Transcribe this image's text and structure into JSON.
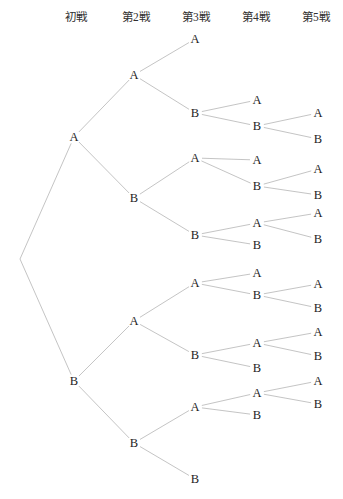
{
  "figure": {
    "width": 343,
    "height": 499,
    "background_color": "#ffffff",
    "line_color": "#b5b5b5",
    "text_color": "#242424"
  },
  "headers": [
    {
      "label": "初戦",
      "x": 76,
      "y": 16
    },
    {
      "label": "第2戦",
      "x": 136,
      "y": 16
    },
    {
      "label": "第3戦",
      "x": 196,
      "y": 16
    },
    {
      "label": "第4戦",
      "x": 256,
      "y": 16
    },
    {
      "label": "第5戦",
      "x": 316,
      "y": 16
    }
  ],
  "chart_data": {
    "type": "diagram",
    "subtype": "binary-tree",
    "title": "",
    "columns": [
      "初戦",
      "第2戦",
      "第3戦",
      "第4戦",
      "第5戦"
    ],
    "column_x": [
      76,
      136,
      196,
      256,
      316
    ],
    "root": {
      "id": "r",
      "label": "",
      "x": 20,
      "y": 259
    },
    "nodes": [
      {
        "id": "A",
        "label": "A",
        "x": 74,
        "y": 137,
        "game": 1,
        "parent": "r"
      },
      {
        "id": "B",
        "label": "B",
        "x": 74,
        "y": 381,
        "game": 1,
        "parent": "r"
      },
      {
        "id": "AA",
        "label": "A",
        "x": 134,
        "y": 75,
        "game": 2,
        "parent": "A"
      },
      {
        "id": "AB",
        "label": "B",
        "x": 134,
        "y": 198,
        "game": 2,
        "parent": "A"
      },
      {
        "id": "BA",
        "label": "A",
        "x": 134,
        "y": 321,
        "game": 2,
        "parent": "B"
      },
      {
        "id": "BB",
        "label": "B",
        "x": 134,
        "y": 443,
        "game": 2,
        "parent": "B"
      },
      {
        "id": "AAA",
        "label": "A",
        "x": 195,
        "y": 39,
        "game": 3,
        "parent": "AA",
        "terminal": true
      },
      {
        "id": "AAB",
        "label": "B",
        "x": 195,
        "y": 113,
        "game": 3,
        "parent": "AA"
      },
      {
        "id": "ABA",
        "label": "A",
        "x": 195,
        "y": 158,
        "game": 3,
        "parent": "AB"
      },
      {
        "id": "ABB",
        "label": "B",
        "x": 195,
        "y": 235,
        "game": 3,
        "parent": "AB"
      },
      {
        "id": "BAA",
        "label": "A",
        "x": 195,
        "y": 283,
        "game": 3,
        "parent": "BA"
      },
      {
        "id": "BAB",
        "label": "B",
        "x": 195,
        "y": 355,
        "game": 3,
        "parent": "BA"
      },
      {
        "id": "BBA",
        "label": "A",
        "x": 195,
        "y": 407,
        "game": 3,
        "parent": "BB"
      },
      {
        "id": "BBB",
        "label": "B",
        "x": 195,
        "y": 479,
        "game": 3,
        "parent": "BB",
        "terminal": true
      },
      {
        "id": "AABA",
        "label": "A",
        "x": 257,
        "y": 100,
        "game": 4,
        "parent": "AAB",
        "terminal": true
      },
      {
        "id": "AABB",
        "label": "B",
        "x": 257,
        "y": 126,
        "game": 4,
        "parent": "AAB"
      },
      {
        "id": "ABAA",
        "label": "A",
        "x": 257,
        "y": 160,
        "game": 4,
        "parent": "ABA",
        "terminal": true
      },
      {
        "id": "ABAB",
        "label": "B",
        "x": 257,
        "y": 186,
        "game": 4,
        "parent": "ABA"
      },
      {
        "id": "ABBA",
        "label": "A",
        "x": 257,
        "y": 223,
        "game": 4,
        "parent": "ABB"
      },
      {
        "id": "ABBB",
        "label": "B",
        "x": 257,
        "y": 245,
        "game": 4,
        "parent": "ABB",
        "terminal": true
      },
      {
        "id": "BAAA",
        "label": "A",
        "x": 257,
        "y": 273,
        "game": 4,
        "parent": "BAA",
        "terminal": true
      },
      {
        "id": "BAAB",
        "label": "B",
        "x": 257,
        "y": 295,
        "game": 4,
        "parent": "BAA"
      },
      {
        "id": "BABA",
        "label": "A",
        "x": 257,
        "y": 343,
        "game": 4,
        "parent": "BAB"
      },
      {
        "id": "BABB",
        "label": "B",
        "x": 257,
        "y": 368,
        "game": 4,
        "parent": "BAB",
        "terminal": true
      },
      {
        "id": "BBAA",
        "label": "A",
        "x": 257,
        "y": 393,
        "game": 4,
        "parent": "BBA"
      },
      {
        "id": "BBAB",
        "label": "B",
        "x": 257,
        "y": 415,
        "game": 4,
        "parent": "BBA",
        "terminal": true
      },
      {
        "id": "AABBA",
        "label": "A",
        "x": 318,
        "y": 113,
        "game": 5,
        "parent": "AABB",
        "terminal": true
      },
      {
        "id": "AABBB",
        "label": "B",
        "x": 318,
        "y": 139,
        "game": 5,
        "parent": "AABB",
        "terminal": true
      },
      {
        "id": "ABABA",
        "label": "A",
        "x": 318,
        "y": 169,
        "game": 5,
        "parent": "ABAB",
        "terminal": true
      },
      {
        "id": "ABABB",
        "label": "B",
        "x": 318,
        "y": 195,
        "game": 5,
        "parent": "ABAB",
        "terminal": true
      },
      {
        "id": "ABBAA",
        "label": "A",
        "x": 318,
        "y": 213,
        "game": 5,
        "parent": "ABBA",
        "terminal": true
      },
      {
        "id": "ABBAB",
        "label": "B",
        "x": 318,
        "y": 239,
        "game": 5,
        "parent": "ABBA",
        "terminal": true
      },
      {
        "id": "BAABA",
        "label": "A",
        "x": 318,
        "y": 284,
        "game": 5,
        "parent": "BAAB",
        "terminal": true
      },
      {
        "id": "BAABB",
        "label": "B",
        "x": 318,
        "y": 308,
        "game": 5,
        "parent": "BAAB",
        "terminal": true
      },
      {
        "id": "BABAA",
        "label": "A",
        "x": 318,
        "y": 332,
        "game": 5,
        "parent": "BABA",
        "terminal": true
      },
      {
        "id": "BABAB",
        "label": "B",
        "x": 318,
        "y": 356,
        "game": 5,
        "parent": "BABA",
        "terminal": true
      },
      {
        "id": "BBAAA",
        "label": "A",
        "x": 318,
        "y": 381,
        "game": 5,
        "parent": "BBAA",
        "terminal": true
      },
      {
        "id": "BBAAB",
        "label": "B",
        "x": 318,
        "y": 404,
        "game": 5,
        "parent": "BBAA",
        "terminal": true
      }
    ]
  }
}
